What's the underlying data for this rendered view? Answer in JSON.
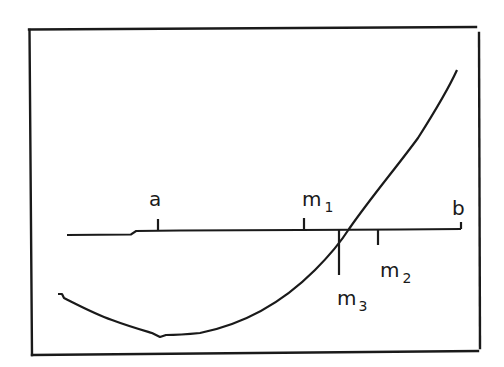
{
  "figure": {
    "kind": "bisection-method-illustration",
    "colors": {
      "ink": "#1a1a1a",
      "background": "#ffffff"
    },
    "labels": {
      "a": {
        "base": "a",
        "sub": ""
      },
      "m1": {
        "base": "m",
        "sub": "1"
      },
      "m2": {
        "base": "m",
        "sub": "2"
      },
      "m3": {
        "base": "m",
        "sub": "3"
      },
      "b": {
        "base": "b",
        "sub": ""
      }
    },
    "axis": {
      "ticks": [
        "a",
        "m1",
        "m3",
        "m2",
        "b"
      ]
    },
    "curve": {
      "description": "convex function crossing the axis between m1 and m2, near m3"
    }
  }
}
